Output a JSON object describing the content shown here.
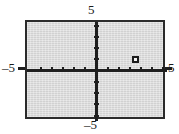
{
  "figure": {
    "background_color": "#ffffff",
    "panel_color": "#d9d9d9",
    "axis_color": "#1f1f1f",
    "frame_color": "#2b2b2b",
    "marker_color": "#1a1a1a"
  },
  "labels": {
    "top": "5",
    "bottom": "–5",
    "left": "–5",
    "right": "5"
  },
  "chart_data": {
    "type": "scatter",
    "title": "",
    "xlabel": "",
    "ylabel": "",
    "xlim": [
      -6.3,
      6.3
    ],
    "ylim": [
      -4.4,
      4.4
    ],
    "xticks": [
      -6,
      -5,
      -4,
      -3,
      -2,
      -1,
      1,
      2,
      3,
      4,
      5,
      6
    ],
    "yticks": [
      -4,
      -3,
      -2,
      -1,
      1,
      2,
      3,
      4
    ],
    "xtick_labels": [
      "",
      "–5",
      "",
      "",
      "",
      "",
      "",
      "",
      "",
      "",
      "5",
      ""
    ],
    "ytick_labels": [
      "",
      "–5",
      "",
      "",
      "",
      "",
      "5",
      ""
    ],
    "grid": false,
    "legend": null,
    "axis_labels_shown": {
      "x_min": "–5",
      "x_max": "5",
      "y_min": "–5",
      "y_max": "5"
    },
    "points": [
      {
        "x": 3.5,
        "y": 1,
        "marker": "open-square"
      }
    ],
    "series": [
      {
        "name": "plotted point",
        "x": [
          3.5
        ],
        "y": [
          1
        ]
      }
    ]
  }
}
